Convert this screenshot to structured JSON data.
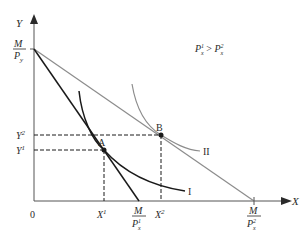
{
  "diagram": {
    "type": "consumer-choice",
    "title": "",
    "condition_label": {
      "base": "P",
      "sub1": "x",
      "sup1": "1",
      "op": " > ",
      "sub2": "x",
      "sup2": "2"
    },
    "axes": {
      "x_label": "X",
      "y_label": "Y",
      "origin_label": "0"
    },
    "y_intercept": {
      "num": "M",
      "den_base": "P",
      "den_sub": "y"
    },
    "x_intercepts": [
      {
        "id": "budget-1",
        "num": "M",
        "den_base": "P",
        "den_sub": "x",
        "den_sup": "1"
      },
      {
        "id": "budget-2",
        "num": "M",
        "den_base": "P",
        "den_sub": "x",
        "den_sup": "2"
      }
    ],
    "points": [
      {
        "id": "A",
        "label": "A",
        "x_tick": {
          "base": "X",
          "sup": "1"
        },
        "y_tick": {
          "base": "Y",
          "sup": "1"
        }
      },
      {
        "id": "B",
        "label": "B",
        "x_tick": {
          "base": "X",
          "sup": "2"
        },
        "y_tick": {
          "base": "Y",
          "sup": "2"
        }
      }
    ],
    "curves": [
      {
        "id": "I",
        "label": "I",
        "kind": "indifference-curve"
      },
      {
        "id": "II",
        "label": "II",
        "kind": "indifference-curve"
      }
    ],
    "lines": [
      {
        "id": "budget-line-1",
        "kind": "budget-line",
        "color": "#1a1a1a"
      },
      {
        "id": "budget-line-2",
        "kind": "budget-line",
        "color": "#8c8c8c"
      }
    ],
    "colors": {
      "axis": "#555555",
      "budget_1": "#1a1a1a",
      "budget_2": "#8c8c8c",
      "curve_I": "#1a1a1a",
      "curve_II": "#8c8c8c",
      "guides": "#1a1a1a",
      "text": "#2a2a2a"
    }
  }
}
